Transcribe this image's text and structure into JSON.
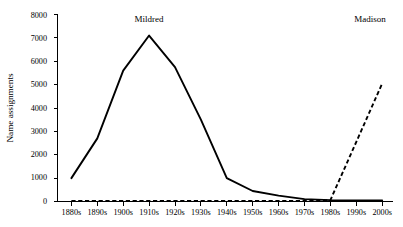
{
  "figure": {
    "background_color": "#ffffff",
    "line_color": "#000000"
  },
  "chart_data": {
    "type": "line",
    "title": "",
    "subtitle": "",
    "xlabel": "",
    "ylabel": "Name assignments",
    "categories": [
      "1880s",
      "1890s",
      "1900s",
      "1910s",
      "1920s",
      "1930s",
      "1940s",
      "1950s",
      "1960s",
      "1970s",
      "1980s",
      "1990s",
      "2000s"
    ],
    "series": [
      {
        "name": "Mildred",
        "style": "solid",
        "color": "#000000",
        "values": [
          1000,
          2700,
          5600,
          7100,
          5750,
          3500,
          1000,
          450,
          250,
          100,
          60,
          50,
          50
        ]
      },
      {
        "name": "Madison",
        "style": "dashed",
        "color": "#000000",
        "values": [
          20,
          20,
          20,
          20,
          20,
          20,
          20,
          20,
          20,
          20,
          60,
          2550,
          5050
        ]
      }
    ],
    "ylim": [
      0,
      8000
    ],
    "ytick_values": [
      0,
      1000,
      2000,
      3000,
      4000,
      5000,
      6000,
      7000,
      8000
    ],
    "ytick_labels": [
      "0",
      "1000",
      "2000",
      "3000",
      "4000",
      "5000",
      "6000",
      "7000",
      "8000"
    ],
    "grid": false,
    "legend": "none",
    "annotations": [
      {
        "text": "Mildred",
        "series": "Mildred",
        "position": "above-peak"
      },
      {
        "text": "Madison",
        "series": "Madison",
        "position": "top-right"
      }
    ]
  }
}
